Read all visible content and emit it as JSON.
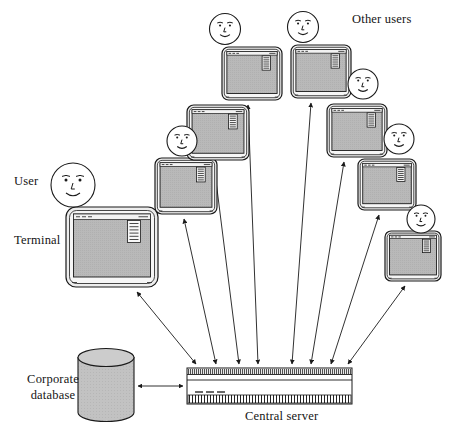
{
  "diagram": {
    "type": "network-topology-diagram",
    "title_present": false,
    "background_color": "#ffffff",
    "line_color": "#1a1a1a",
    "terminal_screen_color": "#b8b8b8",
    "terminal_bezel_color": "#e8e8e8",
    "database_fill_color": "#bfbfbf",
    "server_fill_color": "#ffffff"
  },
  "labels": [
    {
      "id": "user",
      "text": "User",
      "x": 14,
      "y": 174,
      "align": "left",
      "size": 12.5
    },
    {
      "id": "terminal",
      "text": "Terminal",
      "x": 14,
      "y": 233,
      "align": "left",
      "size": 12.5
    },
    {
      "id": "other-users",
      "text": "Other users",
      "x": 352,
      "y": 12,
      "align": "left",
      "size": 12.5
    },
    {
      "id": "corporate-database",
      "text": "Corporate\ndatabase",
      "x": 14,
      "y": 372,
      "align": "center",
      "size": 12.5,
      "width": 78
    },
    {
      "id": "central-server",
      "text": "Central server",
      "x": 245,
      "y": 409,
      "align": "left",
      "size": 12.5
    }
  ],
  "faces": [
    {
      "id": "face-user",
      "cx": 73,
      "cy": 185,
      "r": 22,
      "style": "detailed"
    },
    {
      "id": "face-2",
      "cx": 182,
      "cy": 141,
      "r": 15,
      "style": "simple"
    },
    {
      "id": "face-3",
      "cx": 225,
      "cy": 29,
      "r": 15.5,
      "style": "simple"
    },
    {
      "id": "face-4",
      "cx": 303,
      "cy": 27,
      "r": 15.5,
      "style": "simple"
    },
    {
      "id": "face-5",
      "cx": 363,
      "cy": 84,
      "r": 15,
      "style": "simple"
    },
    {
      "id": "face-6",
      "cx": 399,
      "cy": 139,
      "r": 15,
      "style": "simple"
    },
    {
      "id": "face-7",
      "cx": 421,
      "cy": 219,
      "r": 14,
      "style": "simple"
    }
  ],
  "terminals": [
    {
      "id": "terminal-user",
      "x": 66,
      "y": 207,
      "w": 92,
      "h": 80,
      "label": "Terminal"
    },
    {
      "id": "terminal-2",
      "x": 155,
      "y": 158,
      "w": 62,
      "h": 56,
      "label": ""
    },
    {
      "id": "terminal-3",
      "x": 187,
      "y": 105,
      "w": 62,
      "h": 55,
      "label": ""
    },
    {
      "id": "terminal-4",
      "x": 222,
      "y": 47,
      "w": 60,
      "h": 53,
      "label": ""
    },
    {
      "id": "terminal-5",
      "x": 291,
      "y": 45,
      "w": 60,
      "h": 53,
      "label": ""
    },
    {
      "id": "terminal-6",
      "x": 327,
      "y": 104,
      "w": 60,
      "h": 53,
      "label": ""
    },
    {
      "id": "terminal-7",
      "x": 358,
      "y": 159,
      "w": 58,
      "h": 51,
      "label": ""
    },
    {
      "id": "terminal-8",
      "x": 385,
      "y": 231,
      "w": 56,
      "h": 50,
      "label": ""
    }
  ],
  "server": {
    "id": "central-server",
    "x": 187,
    "y": 368,
    "w": 165,
    "h": 36,
    "top_band_h": 5,
    "dash_marks": 3,
    "bottom_hatch_h": 9,
    "caption": "Central server"
  },
  "database": {
    "id": "corporate-database",
    "cx": 106,
    "cy": 385,
    "rx": 28,
    "ry": 9,
    "body_h": 55,
    "caption": "Corporate database"
  },
  "connections": [
    {
      "from": "terminal-user",
      "to": "server",
      "x1": 137,
      "y1": 292,
      "x2": 196,
      "y2": 364,
      "arrows": "both"
    },
    {
      "from": "terminal-2",
      "to": "server",
      "x1": 184,
      "y1": 219,
      "x2": 216,
      "y2": 364,
      "arrows": "both"
    },
    {
      "from": "terminal-3",
      "to": "server",
      "x1": 214,
      "y1": 165,
      "x2": 239,
      "y2": 364,
      "arrows": "both"
    },
    {
      "from": "terminal-4",
      "to": "server",
      "x1": 248,
      "y1": 105,
      "x2": 258,
      "y2": 364,
      "arrows": "both"
    },
    {
      "from": "terminal-5",
      "to": "server",
      "x1": 311,
      "y1": 103,
      "x2": 292,
      "y2": 364,
      "arrows": "both"
    },
    {
      "from": "terminal-6",
      "to": "server",
      "x1": 344,
      "y1": 162,
      "x2": 311,
      "y2": 364,
      "arrows": "both"
    },
    {
      "from": "terminal-7",
      "to": "server",
      "x1": 379,
      "y1": 215,
      "x2": 331,
      "y2": 364,
      "arrows": "both"
    },
    {
      "from": "terminal-8",
      "to": "server",
      "x1": 405,
      "y1": 286,
      "x2": 348,
      "y2": 364,
      "arrows": "both"
    },
    {
      "from": "database",
      "to": "server",
      "x1": 138,
      "y1": 386,
      "x2": 183,
      "y2": 386,
      "arrows": "both"
    }
  ]
}
